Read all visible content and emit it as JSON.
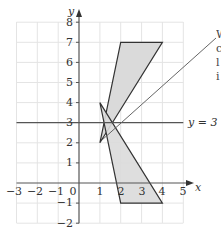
{
  "diagram": {
    "axes": {
      "x_label": "x",
      "y_label": "y",
      "x_ticks": [
        "−3",
        "−2",
        "−1",
        "0",
        "1",
        "2",
        "3",
        "4",
        "5"
      ],
      "y_ticks": [
        "8",
        "7",
        "6",
        "5",
        "4",
        "3",
        "2",
        "1",
        "−1",
        "−2"
      ],
      "x_range": [
        -3,
        5
      ],
      "y_range": [
        -2,
        8
      ]
    },
    "mirror_line": {
      "label": "y = 3",
      "y": 3
    },
    "shapes": [
      {
        "name": "object-triangle",
        "vertices": [
          [
            1,
            2
          ],
          [
            2,
            7
          ],
          [
            4,
            7
          ]
        ],
        "fill": "#d9d9d9",
        "stroke": "#333333"
      },
      {
        "name": "image-triangle",
        "vertices": [
          [
            1,
            4
          ],
          [
            2,
            -1
          ],
          [
            4,
            -1
          ]
        ],
        "fill": "#d9d9d9",
        "stroke": "#333333"
      }
    ],
    "callout": {
      "lines": [
        "W",
        "c",
        "l",
        "i"
      ]
    },
    "colors": {
      "grid": "#e2e2e2",
      "axis": "#555555",
      "shape_fill": "#d9d9d9",
      "shape_stroke": "#333333"
    }
  }
}
